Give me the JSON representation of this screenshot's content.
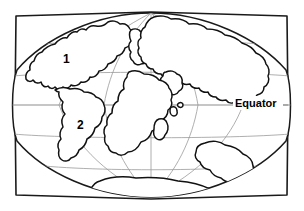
{
  "figure": {
    "type": "map-diagram",
    "title": ""
  },
  "labels": {
    "continent_1": "1",
    "continent_2": "2",
    "equator": "Equator"
  },
  "colors": {
    "background": "#ffffff",
    "coastline": "#111111",
    "frame": "#1a1a1a",
    "graticule": "#9b9b9b",
    "equator": "#8d8d8d",
    "label_text": "#000000"
  },
  "graticule": {
    "parallels_count": 5,
    "meridians_count": 5,
    "equator_shown": true
  },
  "geometry": {
    "frame_left": 15,
    "frame_right": 288,
    "frame_top": 13,
    "frame_bottom": 197,
    "center_x": 151,
    "center_y": 105
  }
}
